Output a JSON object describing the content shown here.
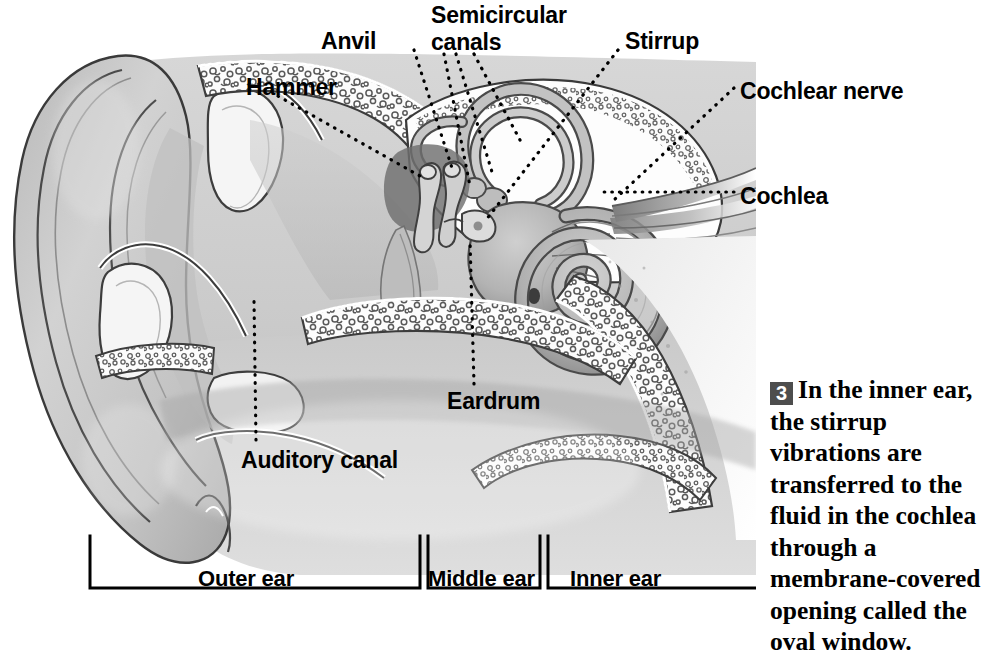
{
  "figure": {
    "type": "anatomical-diagram"
  },
  "labels": [
    {
      "id": "hammer",
      "text": "Hammer",
      "x": 246,
      "y": 74
    },
    {
      "id": "anvil",
      "text": "Anvil",
      "x": 321,
      "y": 28
    },
    {
      "id": "semicircular_canals",
      "text": "Semicircular",
      "x": 431,
      "y": 2
    },
    {
      "id": "semicircular_canals2",
      "text": "canals",
      "x": 431,
      "y": 28
    },
    {
      "id": "stirrup",
      "text": "Stirrup",
      "x": 625,
      "y": 28
    },
    {
      "id": "cochlear_nerve",
      "text": "Cochlear nerve",
      "x": 740,
      "y": 78
    },
    {
      "id": "cochlea",
      "text": "Cochlea",
      "x": 740,
      "y": 183
    },
    {
      "id": "eardrum",
      "text": "Eardrum",
      "x": 447,
      "y": 389
    },
    {
      "id": "auditory_canal",
      "text": "Auditory canal",
      "x": 241,
      "y": 447
    }
  ],
  "region_labels": [
    {
      "id": "outer_ear",
      "text": "Outer ear",
      "x": 198,
      "y": 567
    },
    {
      "id": "middle_ear",
      "text": "Middle ear",
      "x": 428,
      "y": 567
    },
    {
      "id": "inner_ear",
      "text": "Inner ear",
      "x": 570,
      "y": 567
    }
  ],
  "brackets": [
    {
      "id": "outer_ear_bracket",
      "x1": 90,
      "x2": 420
    },
    {
      "id": "middle_ear_bracket",
      "x1": 428,
      "x2": 540
    },
    {
      "id": "inner_ear_bracket",
      "x1": 548,
      "x2": 756
    }
  ],
  "caption": {
    "number": "3",
    "text": "In the inner ear, the stirrup vibrations are transferred to the fluid in the cochlea through a membrane-covered opening called the oval window."
  },
  "colors": {
    "ink": "#000000",
    "badge_background": "#4d4d4d",
    "badge_text": "#ffffff",
    "tissue_light": "#d9d9d9",
    "tissue_mid": "#c2c2c2",
    "tissue_dark": "#9a9a9a",
    "cartilage": "#f4f4f4",
    "bone_fill": "#fbfbfb",
    "page_background": "#ffffff"
  }
}
